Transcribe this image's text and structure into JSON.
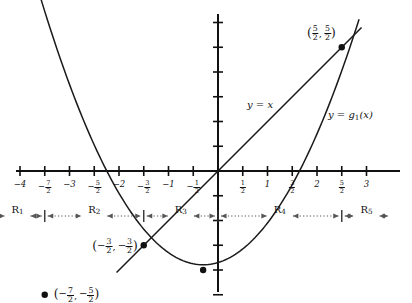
{
  "figure": {
    "type": "math-graph"
  },
  "axes": {
    "x_ticks_labeled": [
      {
        "value": -4,
        "label_kind": "int",
        "int": "−4"
      },
      {
        "value": -3.5,
        "label_kind": "frac",
        "sign": "−",
        "num": "7",
        "den": "2"
      },
      {
        "value": -3,
        "label_kind": "int",
        "int": "−3"
      },
      {
        "value": -2.5,
        "label_kind": "frac",
        "sign": "−",
        "num": "5",
        "den": "2"
      },
      {
        "value": -2,
        "label_kind": "int",
        "int": "−2"
      },
      {
        "value": -1.5,
        "label_kind": "frac",
        "sign": "−",
        "num": "3",
        "den": "2"
      },
      {
        "value": -1,
        "label_kind": "int",
        "int": "−1"
      },
      {
        "value": -0.5,
        "label_kind": "frac",
        "sign": "−",
        "num": "1",
        "den": "2"
      },
      {
        "value": 0.5,
        "label_kind": "frac",
        "sign": "",
        "num": "1",
        "den": "2"
      },
      {
        "value": 1,
        "label_kind": "int",
        "int": "1"
      },
      {
        "value": 1.5,
        "label_kind": "frac",
        "sign": "",
        "num": "3",
        "den": "2"
      },
      {
        "value": 2,
        "label_kind": "int",
        "int": "2"
      },
      {
        "value": 2.5,
        "label_kind": "frac",
        "sign": "",
        "num": "5",
        "den": "2"
      },
      {
        "value": 3,
        "label_kind": "int",
        "int": "3"
      }
    ],
    "x_range": [
      -4.6,
      3.5
    ],
    "y_range": [
      -2.9,
      3.3
    ],
    "y_ticks_labeled": [],
    "y_tick_step": 0.5,
    "grid": false,
    "origin_label": ""
  },
  "curves": [
    {
      "name": "parabola",
      "label": "y = g₁(x)",
      "label_parts": {
        "lhs": "y",
        "eq": "=",
        "fn": "g",
        "sub": "1",
        "arg": "(x)"
      },
      "color": "#1a1a1a",
      "x_from": -3.75,
      "x_to": 2.85
    },
    {
      "name": "identity-line",
      "label": "y = x",
      "label_parts": {
        "lhs": "y",
        "eq": "=",
        "rhs": "x"
      },
      "color": "#1a1a1a",
      "x_from": -2.05,
      "x_to": 2.9
    }
  ],
  "points": [
    {
      "id": "p-upper-left",
      "x": -3.5,
      "y": -2.5,
      "label": "(−7/2, −5/2)",
      "parts": {
        "x_sign": "−",
        "x_num": "7",
        "x_den": "2",
        "y_sign": "−",
        "y_num": "5",
        "y_den": "2"
      },
      "on": "parabola"
    },
    {
      "id": "p-lower-left",
      "x": -1.5,
      "y": -1.5,
      "label": "(−3/2, −3/2)",
      "parts": {
        "x_sign": "−",
        "x_num": "3",
        "x_den": "2",
        "y_sign": "−",
        "y_num": "3",
        "y_den": "2"
      },
      "on": "intersection"
    },
    {
      "id": "p-upper-right",
      "x": 2.5,
      "y": 2.5,
      "label": "(5/2, 5/2)",
      "parts": {
        "x_sign": "",
        "x_num": "5",
        "x_den": "2",
        "y_sign": "",
        "y_num": "5",
        "y_den": "2"
      },
      "on": "intersection"
    },
    {
      "id": "p-vertex",
      "x": -0.3,
      "y": -2.0,
      "label": "",
      "parts": null,
      "on": "parabola"
    }
  ],
  "regions": {
    "boundaries": [
      -3.5,
      -1.5,
      0,
      2.5
    ],
    "items": [
      {
        "id": "R1",
        "base": "R",
        "sub": "1",
        "from": -4.6,
        "to": -3.5
      },
      {
        "id": "R2",
        "base": "R",
        "sub": "2",
        "from": -3.5,
        "to": -1.5
      },
      {
        "id": "R3",
        "base": "R",
        "sub": "3",
        "from": -1.5,
        "to": 0
      },
      {
        "id": "R4",
        "base": "R",
        "sub": "4",
        "from": 0,
        "to": 2.5
      },
      {
        "id": "R5",
        "base": "R",
        "sub": "5",
        "from": 2.5,
        "to": 3.5
      }
    ]
  },
  "chart_data": {
    "type": "line",
    "title": "",
    "xlabel": "",
    "ylabel": "",
    "xlim": [
      -4.6,
      3.5
    ],
    "ylim": [
      -2.9,
      3.3
    ],
    "grid": false,
    "legend": "inline-labels",
    "series": [
      {
        "name": "y = g1(x)",
        "kind": "parabola",
        "x": [
          -3.75,
          -3.5,
          -3.0,
          -2.5,
          -2.0,
          -1.5,
          -1.0,
          -0.5,
          -0.3,
          0.0,
          0.5,
          1.0,
          1.5,
          2.0,
          2.5,
          2.85
        ],
        "y": [
          -2.18,
          -2.5,
          -3.0,
          -3.22,
          -3.25,
          -3.0,
          -2.5,
          -2.1,
          -2.0,
          -1.85,
          -1.3,
          -0.5,
          0.5,
          1.4,
          2.5,
          3.3
        ]
      },
      {
        "name": "y = x",
        "kind": "line",
        "x": [
          -2.05,
          2.9
        ],
        "y": [
          -2.05,
          2.9
        ]
      }
    ],
    "points": [
      {
        "x": -3.5,
        "y": -2.5
      },
      {
        "x": -1.5,
        "y": -1.5
      },
      {
        "x": 2.5,
        "y": 2.5
      },
      {
        "x": -0.3,
        "y": -2.0
      }
    ]
  }
}
